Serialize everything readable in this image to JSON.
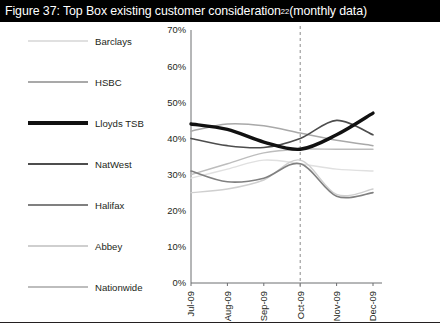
{
  "title": {
    "prefix": "Figure 37: Top Box existing customer consideration",
    "superscript": "22",
    "suffix": " (monthly data)"
  },
  "legend": {
    "position": "left",
    "items": [
      {
        "label": "Barclays",
        "color": "#e0e0e0",
        "width": 1.4
      },
      {
        "label": "HSBC",
        "color": "#a9a9a9",
        "width": 1.5
      },
      {
        "label": "Lloyds TSB",
        "color": "#111111",
        "width": 3.4
      },
      {
        "label": "NatWest",
        "color": "#4d4d4d",
        "width": 1.6
      },
      {
        "label": "Halifax",
        "color": "#808080",
        "width": 1.6
      },
      {
        "label": "Abbey",
        "color": "#cfcfcf",
        "width": 1.4
      },
      {
        "label": "Nationwide",
        "color": "#bdbdbd",
        "width": 1.4
      }
    ]
  },
  "chart_data": {
    "type": "line",
    "title": "Figure 37: Top Box existing customer consideration22 (monthly data)",
    "xlabel": "",
    "ylabel": "",
    "x": [
      "Jul-09",
      "Aug-09",
      "Sep-09",
      "Oct-09",
      "Nov-09",
      "Dec-09"
    ],
    "ylim": [
      0,
      70
    ],
    "yticks": [
      0,
      10,
      20,
      30,
      40,
      50,
      60,
      70
    ],
    "ytick_labels": [
      "0%",
      "10%",
      "20%",
      "30%",
      "40%",
      "50%",
      "60%",
      "70%"
    ],
    "grid": false,
    "legend_position": "left",
    "annotations": [
      {
        "type": "vertical-dashed-line",
        "x": "Oct-09"
      }
    ],
    "series": [
      {
        "name": "Barclays",
        "color": "#e0e0e0",
        "width": 1.4,
        "values": [
          29.0,
          31.5,
          34.0,
          33.0,
          31.5,
          31.0
        ]
      },
      {
        "name": "HSBC",
        "color": "#a9a9a9",
        "width": 1.5,
        "values": [
          42.0,
          44.0,
          43.5,
          41.5,
          39.5,
          38.0
        ]
      },
      {
        "name": "Lloyds TSB",
        "color": "#111111",
        "width": 3.4,
        "values": [
          44.0,
          42.5,
          39.0,
          37.0,
          41.0,
          47.0
        ]
      },
      {
        "name": "NatWest",
        "color": "#4d4d4d",
        "width": 1.6,
        "values": [
          40.0,
          38.0,
          37.5,
          40.0,
          45.0,
          41.0
        ]
      },
      {
        "name": "Halifax",
        "color": "#808080",
        "width": 1.6,
        "values": [
          31.0,
          28.0,
          29.0,
          33.0,
          24.0,
          25.0
        ]
      },
      {
        "name": "Abbey",
        "color": "#cfcfcf",
        "width": 1.4,
        "values": [
          25.0,
          26.0,
          28.5,
          34.0,
          24.5,
          26.0
        ]
      },
      {
        "name": "Nationwide",
        "color": "#bdbdbd",
        "width": 1.4,
        "values": [
          30.0,
          33.0,
          36.0,
          37.0,
          37.0,
          37.0
        ]
      }
    ]
  }
}
